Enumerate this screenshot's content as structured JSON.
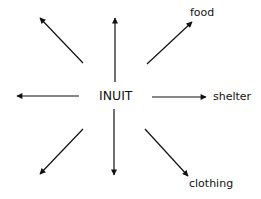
{
  "diagram": {
    "center": {
      "label": "INUIT",
      "x": 115,
      "y": 96
    },
    "arrows": [
      {
        "id": "up-left",
        "x1": 83,
        "y1": 63,
        "x2": 40,
        "y2": 18,
        "label": ""
      },
      {
        "id": "up",
        "x1": 115,
        "y1": 82,
        "x2": 115,
        "y2": 18,
        "label": ""
      },
      {
        "id": "up-right",
        "x1": 147,
        "y1": 64,
        "x2": 192,
        "y2": 22,
        "label": "food"
      },
      {
        "id": "left",
        "x1": 79,
        "y1": 96,
        "x2": 17,
        "y2": 96,
        "label": ""
      },
      {
        "id": "right",
        "x1": 152,
        "y1": 97,
        "x2": 206,
        "y2": 97,
        "label": "shelter"
      },
      {
        "id": "down-left",
        "x1": 83,
        "y1": 129,
        "x2": 40,
        "y2": 174,
        "label": ""
      },
      {
        "id": "down",
        "x1": 114,
        "y1": 109,
        "x2": 114,
        "y2": 175,
        "label": ""
      },
      {
        "id": "down-right",
        "x1": 145,
        "y1": 129,
        "x2": 188,
        "y2": 176,
        "label": "clothing"
      }
    ],
    "labels": {
      "food": "food",
      "shelter": "shelter",
      "clothing": "clothing"
    },
    "stroke_color": "#111111"
  }
}
